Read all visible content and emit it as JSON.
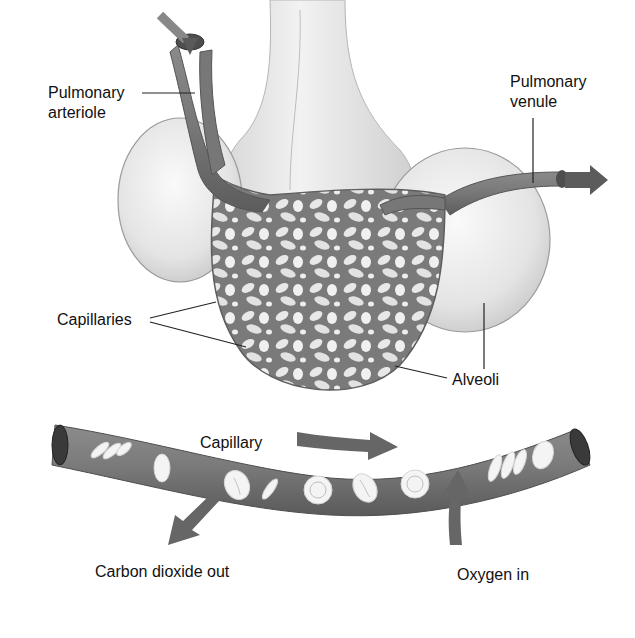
{
  "diagram": {
    "type": "anatomical-illustration",
    "colors": {
      "vessel": "#7a7a7a",
      "vessel_dark": "#5a5a5a",
      "alveolus": "#e6e6e6",
      "alveolus_edge": "#9a9a9a",
      "bronchiole": "#ececec",
      "blood_cell": "#f4f4f4",
      "label_text": "#111111",
      "leader_line": "#222222",
      "background": "#ffffff"
    },
    "labels": {
      "pulmonary_arteriole_line1": "Pulmonary",
      "pulmonary_arteriole_line2": "arteriole",
      "pulmonary_venule_line1": "Pulmonary",
      "pulmonary_venule_line2": "venule",
      "capillaries": "Capillaries",
      "alveoli": "Alveoli",
      "capillary": "Capillary",
      "carbon_dioxide_out": "Carbon dioxide out",
      "oxygen_in": "Oxygen in"
    },
    "arrows": [
      {
        "name": "arteriole-inflow",
        "direction": "down"
      },
      {
        "name": "venule-outflow",
        "direction": "right"
      },
      {
        "name": "blood-flow",
        "direction": "right"
      },
      {
        "name": "co2-out",
        "direction": "down-left"
      },
      {
        "name": "o2-in",
        "direction": "up"
      }
    ]
  }
}
